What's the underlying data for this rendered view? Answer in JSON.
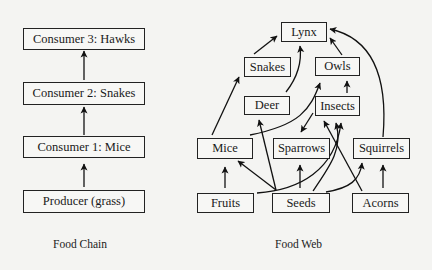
{
  "food_chain": {
    "caption": "Food Chain",
    "nodes": [
      {
        "id": "hawks",
        "label": "Consumer 3: Hawks"
      },
      {
        "id": "snakes",
        "label": "Consumer 2: Snakes"
      },
      {
        "id": "mice",
        "label": "Consumer 1: Mice"
      },
      {
        "id": "grass",
        "label": "Producer (grass)"
      }
    ],
    "edges": [
      {
        "from": "grass",
        "to": "mice"
      },
      {
        "from": "mice",
        "to": "snakes"
      },
      {
        "from": "snakes",
        "to": "hawks"
      }
    ]
  },
  "food_web": {
    "caption": "Food Web",
    "nodes": [
      {
        "id": "lynx",
        "label": "Lynx"
      },
      {
        "id": "snakes",
        "label": "Snakes"
      },
      {
        "id": "owls",
        "label": "Owls"
      },
      {
        "id": "deer",
        "label": "Deer"
      },
      {
        "id": "insects",
        "label": "Insects"
      },
      {
        "id": "mice",
        "label": "Mice"
      },
      {
        "id": "sparrows",
        "label": "Sparrows"
      },
      {
        "id": "squirrels",
        "label": "Squirrels"
      },
      {
        "id": "fruits",
        "label": "Fruits"
      },
      {
        "id": "seeds",
        "label": "Seeds"
      },
      {
        "id": "acorns",
        "label": "Acorns"
      }
    ],
    "edges": [
      {
        "from": "snakes",
        "to": "lynx"
      },
      {
        "from": "deer",
        "to": "lynx"
      },
      {
        "from": "owls",
        "to": "lynx"
      },
      {
        "from": "squirrels",
        "to": "lynx"
      },
      {
        "from": "insects",
        "to": "owls"
      },
      {
        "from": "mice",
        "to": "snakes"
      },
      {
        "from": "mice",
        "to": "owls"
      },
      {
        "from": "insects",
        "to": "sparrows"
      },
      {
        "from": "fruits",
        "to": "mice"
      },
      {
        "from": "seeds",
        "to": "mice"
      },
      {
        "from": "seeds",
        "to": "deer"
      },
      {
        "from": "seeds",
        "to": "sparrows"
      },
      {
        "from": "seeds",
        "to": "insects"
      },
      {
        "from": "seeds",
        "to": "squirrels"
      },
      {
        "from": "fruits",
        "to": "insects"
      },
      {
        "from": "acorns",
        "to": "insects"
      },
      {
        "from": "acorns",
        "to": "squirrels"
      }
    ]
  }
}
